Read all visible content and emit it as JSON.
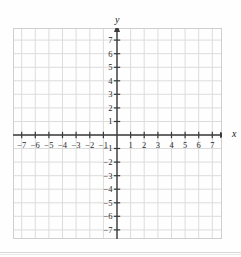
{
  "figure": {
    "kind": "coordinate-plane",
    "axis_labels": {
      "x": "x",
      "y": "y"
    },
    "colors": {
      "background": "#fefefe",
      "grid_line": "#dcdcdc",
      "grid_border": "#cfcfcf",
      "axis": "#3a3a3a",
      "tick_text": "#2a2a2a"
    }
  },
  "chart_data": {
    "type": "scatter",
    "title": "",
    "xlabel": "x",
    "ylabel": "y",
    "xlim": [
      -7.5,
      7.5
    ],
    "ylim": [
      -7.5,
      7.5
    ],
    "xticks": [
      -7,
      -6,
      -5,
      -4,
      -3,
      -2,
      -1,
      1,
      2,
      3,
      4,
      5,
      6,
      7
    ],
    "yticks": [
      7,
      6,
      5,
      4,
      3,
      2,
      1,
      -1,
      -2,
      -3,
      -4,
      -5,
      -6,
      -7
    ],
    "xticklabels": [
      "−7",
      "−6",
      "−5",
      "−4",
      "−3",
      "−2",
      "−1",
      "1",
      "2",
      "3",
      "4",
      "5",
      "6",
      "7"
    ],
    "yticklabels": [
      "7",
      "6",
      "5",
      "4",
      "3",
      "2",
      "1",
      "−1",
      "−2",
      "−3",
      "−4",
      "−5",
      "−6",
      "−7"
    ],
    "grid": true,
    "grid_spacing": 1,
    "legend": null,
    "series": [],
    "x": [],
    "values": [],
    "annotations": []
  },
  "ticks": {
    "x_negative": [
      {
        "value": -7,
        "label": "−7"
      },
      {
        "value": -6,
        "label": "−6"
      },
      {
        "value": -5,
        "label": "−5"
      },
      {
        "value": -4,
        "label": "−4"
      },
      {
        "value": -3,
        "label": "−3"
      },
      {
        "value": -2,
        "label": "−2"
      },
      {
        "value": -1,
        "label": "−1"
      }
    ],
    "x_positive": [
      {
        "value": 1,
        "label": "1"
      },
      {
        "value": 2,
        "label": "2"
      },
      {
        "value": 3,
        "label": "3"
      },
      {
        "value": 4,
        "label": "4"
      },
      {
        "value": 5,
        "label": "5"
      },
      {
        "value": 6,
        "label": "6"
      },
      {
        "value": 7,
        "label": "7"
      }
    ],
    "y_positive": [
      {
        "value": 7,
        "label": "7"
      },
      {
        "value": 6,
        "label": "6"
      },
      {
        "value": 5,
        "label": "5"
      },
      {
        "value": 4,
        "label": "4"
      },
      {
        "value": 3,
        "label": "3"
      },
      {
        "value": 2,
        "label": "2"
      },
      {
        "value": 1,
        "label": "1"
      }
    ],
    "y_negative": [
      {
        "value": -1,
        "label": "−1"
      },
      {
        "value": -2,
        "label": "−2"
      },
      {
        "value": -3,
        "label": "−3"
      },
      {
        "value": -4,
        "label": "−4"
      },
      {
        "value": -5,
        "label": "−5"
      },
      {
        "value": -6,
        "label": "−6"
      },
      {
        "value": -7,
        "label": "−7"
      }
    ]
  }
}
